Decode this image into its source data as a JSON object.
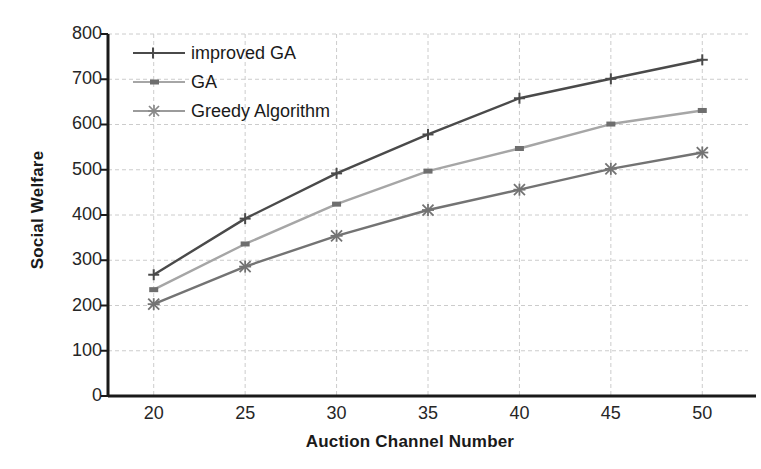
{
  "chart_data": {
    "type": "line",
    "title": "",
    "xlabel": "Auction Channel Number",
    "ylabel": "Social Welfare",
    "x": [
      20,
      25,
      30,
      35,
      40,
      45,
      50
    ],
    "xtick_labels": [
      "20",
      "25",
      "30",
      "35",
      "40",
      "45",
      "50"
    ],
    "ytick_labels": [
      "0",
      "100",
      "200",
      "300",
      "400",
      "500",
      "600",
      "700",
      "800"
    ],
    "yticks": [
      0,
      100,
      200,
      300,
      400,
      500,
      600,
      700,
      800
    ],
    "xlim": [
      17.5,
      52.5
    ],
    "ylim": [
      0,
      800
    ],
    "grid": true,
    "grid_style": "dashed",
    "legend_position": "upper-left",
    "series": [
      {
        "name": "improved GA",
        "marker": "plus",
        "color": "#4a4a4a",
        "values": [
          268,
          392,
          492,
          578,
          658,
          701,
          743
        ]
      },
      {
        "name": "GA",
        "marker": "square",
        "color": "#a6a6a6",
        "values": [
          235,
          336,
          424,
          497,
          547,
          601,
          631
        ]
      },
      {
        "name": "Greedy Algorithm",
        "marker": "asterisk",
        "color": "#737373",
        "values": [
          203,
          286,
          354,
          411,
          456,
          502,
          538
        ]
      }
    ]
  },
  "axis": {
    "y_title": "Social Welfare",
    "x_title": "Auction Channel Number"
  },
  "legend": {
    "items": [
      {
        "label": "improved GA"
      },
      {
        "label": "GA"
      },
      {
        "label": "Greedy Algorithm"
      }
    ]
  },
  "colors": {
    "improved_ga": "#4a4a4a",
    "ga": "#a6a6a6",
    "greedy": "#737373",
    "axis": "#1a1a1a",
    "grid": "#cccccc",
    "background": "#ffffff"
  }
}
